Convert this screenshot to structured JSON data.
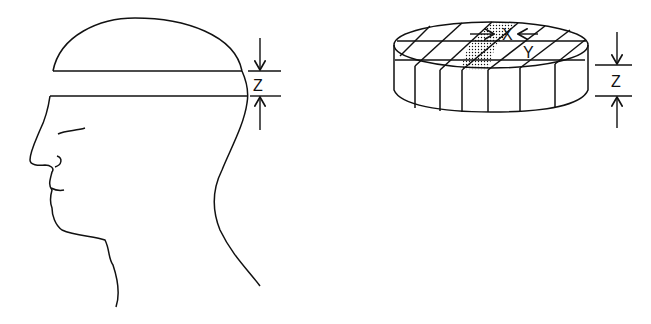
{
  "head_diagram": {
    "dimension_label": "Z"
  },
  "disc_diagram": {
    "labels": {
      "x": "X",
      "y": "Y",
      "z": "Z"
    }
  }
}
